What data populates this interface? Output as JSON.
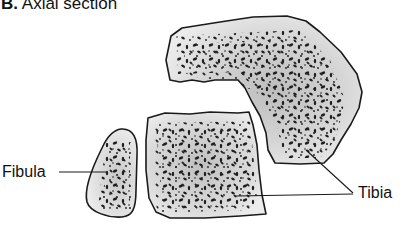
{
  "figure": {
    "panel_letter": "B.",
    "title": "Axial section"
  },
  "labels": {
    "fibula": "Fibula",
    "tibia": "Tibia"
  },
  "colors": {
    "bone_fill": "#e6e6e6",
    "bone_center": "#c4c4c4",
    "outline": "#1a1a1a",
    "pores": "#1e1e1e",
    "background": "#ffffff"
  },
  "structures": [
    {
      "name": "tibia-upper-fragment"
    },
    {
      "name": "tibia-lower-fragment"
    },
    {
      "name": "fibula-cross-section"
    }
  ]
}
